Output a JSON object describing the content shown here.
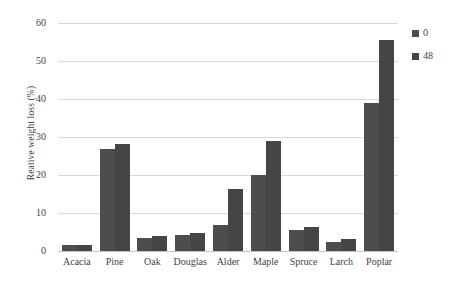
{
  "chart_data": {
    "type": "bar",
    "title": "",
    "xlabel": "",
    "ylabel": "Reative weight loss (%)",
    "ylim": [
      0,
      60
    ],
    "yticks": [
      60,
      50,
      40,
      30,
      20,
      10,
      0
    ],
    "grid": true,
    "legend_position": "right",
    "categories": [
      "Acacia",
      "Pine",
      "Oak",
      "Douglas",
      "Alder",
      "Maple",
      "Spruce",
      "Larch",
      "Poplar"
    ],
    "series": [
      {
        "name": "0",
        "color": "#4d4d4d",
        "values": [
          1.5,
          26.8,
          3.3,
          4.2,
          6.8,
          20.0,
          5.6,
          2.5,
          38.9
        ]
      },
      {
        "name": "48",
        "color": "#454545",
        "values": [
          1.5,
          28.2,
          3.9,
          4.7,
          16.4,
          29.0,
          6.2,
          3.1,
          55.5
        ]
      }
    ]
  },
  "legend": {
    "items": [
      {
        "label": "0"
      },
      {
        "label": "48"
      }
    ]
  },
  "colors": {
    "bar_series_0": "#4d4d4d",
    "bar_series_48": "#454545",
    "gridline": "#d9d9d9",
    "text": "#3f3f3f",
    "background": "#ffffff"
  }
}
